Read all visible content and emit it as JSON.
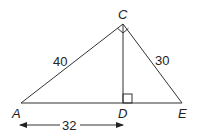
{
  "diagram": {
    "type": "right-triangle-with-altitude",
    "points": {
      "A": {
        "label": "A",
        "x": 21,
        "y": 103
      },
      "C": {
        "label": "C",
        "x": 123,
        "y": 24
      },
      "D": {
        "label": "D",
        "x": 123,
        "y": 103
      },
      "E": {
        "label": "E",
        "x": 182,
        "y": 103
      }
    },
    "segments": {
      "AC": {
        "label": "40"
      },
      "CE": {
        "label": "30"
      },
      "AD": {
        "label": "32"
      }
    },
    "right_angles": [
      "ACE",
      "CDE"
    ],
    "stroke_color": "#333333"
  }
}
